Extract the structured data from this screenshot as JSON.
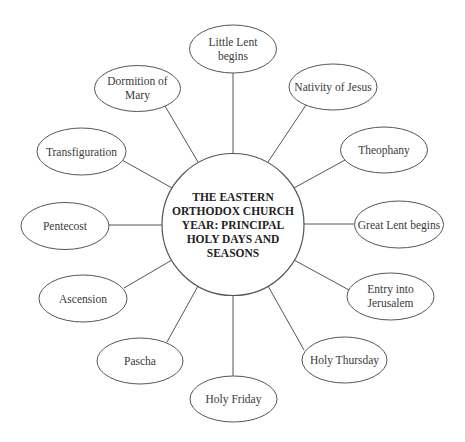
{
  "diagram": {
    "type": "radial-hub",
    "hub": {
      "title_lines": [
        "THE EASTERN",
        "ORTHODOX CHURCH",
        "YEAR: PRINCIPAL",
        "HOLY DAYS AND",
        "SEASONS"
      ]
    },
    "nodes": [
      {
        "id": "little-lent",
        "lines": [
          "Little Lent",
          "begins"
        ]
      },
      {
        "id": "nativity",
        "lines": [
          "Nativity of Jesus"
        ]
      },
      {
        "id": "theophany",
        "lines": [
          "Theophany"
        ]
      },
      {
        "id": "great-lent",
        "lines": [
          "Great Lent begins"
        ]
      },
      {
        "id": "entry-jerusalem",
        "lines": [
          "Entry into",
          "Jerusalem"
        ]
      },
      {
        "id": "holy-thursday",
        "lines": [
          "Holy Thursday"
        ]
      },
      {
        "id": "holy-friday",
        "lines": [
          "Holy Friday"
        ]
      },
      {
        "id": "pascha",
        "lines": [
          "Pascha"
        ]
      },
      {
        "id": "ascension",
        "lines": [
          "Ascension"
        ]
      },
      {
        "id": "pentecost",
        "lines": [
          "Pentecost"
        ]
      },
      {
        "id": "transfiguration",
        "lines": [
          "Transfiguration"
        ]
      },
      {
        "id": "dormition",
        "lines": [
          "Dormition of",
          "Mary"
        ]
      }
    ]
  }
}
